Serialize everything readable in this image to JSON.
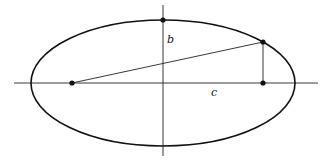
{
  "diagram": {
    "labels": {
      "b": "b",
      "c": "c"
    },
    "points": [
      {
        "name": "top-vertex",
        "description": "end of minor axis"
      },
      {
        "name": "left-focus",
        "description": "focus"
      },
      {
        "name": "point-on-ellipse",
        "description": "point on ellipse"
      },
      {
        "name": "right-focus",
        "description": "foot on major axis"
      }
    ],
    "colors": {
      "stroke": "#111111",
      "background": "#ffffff"
    }
  }
}
